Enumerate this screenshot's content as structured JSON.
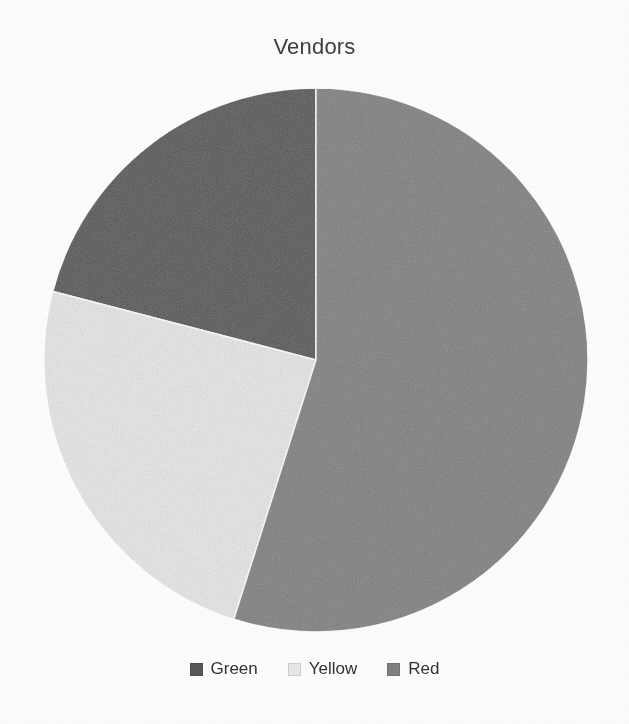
{
  "chart_data": {
    "type": "pie",
    "title": "Vendors",
    "categories": [
      "Green",
      "Yellow",
      "Red"
    ],
    "values": [
      20.9,
      24.2,
      54.9
    ],
    "value_unit": "percent",
    "start_angle_deg": 0,
    "direction": "clockwise",
    "slice_angles_deg": [
      75.4,
      87.0,
      197.6
    ],
    "slice_colors": [
      "#585858",
      "#e8e8e8",
      "#808080"
    ],
    "legend_position": "bottom",
    "grid": false,
    "xlabel": "",
    "ylabel": "",
    "slices": [
      {
        "label": "Green",
        "value": 20.9,
        "color": "#585858",
        "start_deg": 284.6,
        "end_deg": 360.0
      },
      {
        "label": "Yellow",
        "value": 24.2,
        "color": "#e8e8e8",
        "start_deg": 197.6,
        "end_deg": 284.6
      },
      {
        "label": "Red",
        "value": 54.9,
        "color": "#808080",
        "start_deg": 0.0,
        "end_deg": 197.6
      }
    ]
  },
  "title": {
    "text": "Vendors"
  },
  "legend": {
    "items": [
      {
        "label": "Green",
        "color": "#585858"
      },
      {
        "label": "Yellow",
        "color": "#e8e8e8"
      },
      {
        "label": "Red",
        "color": "#808080"
      }
    ]
  },
  "colors": {
    "background": "#fdfdfd",
    "title_text": "#3f3f3f",
    "legend_text": "#333333",
    "green_slice": "#585858",
    "yellow_slice": "#e8e8e8",
    "red_slice": "#808080"
  },
  "showthrough": {
    "line1": "has the been",
    "line2": "a Minnesota",
    "line3": "and how",
    "line4": "that as all the",
    "line5": "now not page"
  }
}
